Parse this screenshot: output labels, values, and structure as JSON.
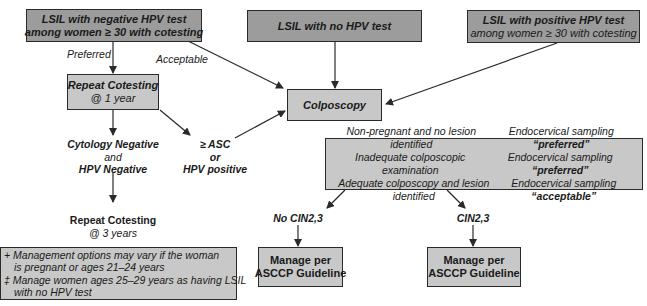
{
  "nodes": {
    "lsil_neg_hpv": {
      "line1": "LSIL with negative HPV test",
      "line2": "among women ≥ 30 with cotesting"
    },
    "lsil_no_hpv": {
      "line1": "LSIL with no HPV test"
    },
    "lsil_pos_hpv": {
      "line1": "LSIL with positive HPV test",
      "line2": "among women ≥ 30 with cotesting"
    },
    "repeat_cotesting_1yr": {
      "line1": "Repeat Cotesting",
      "line2": "@ 1 year"
    },
    "colposcopy": {
      "line1": "Colposcopy"
    },
    "cyto_neg": {
      "line1": "Cytology Negative",
      "line2": "and",
      "line3": "HPV Negative"
    },
    "asc_or_hpv": {
      "line1": "≥ ASC",
      "line2": "or",
      "line3": "HPV positive"
    },
    "repeat_cotesting_3yr": {
      "line1": "Repeat Cotesting",
      "line2": "@ 3 years"
    },
    "endocervical": {
      "rows": [
        {
          "condition": "Non-pregnant and no lesion identified",
          "action": "Endocervical sampling",
          "level": "“preferred”"
        },
        {
          "condition": "Inadequate colposcopic examination",
          "action": "Endocervical sampling",
          "level": "“preferred”"
        },
        {
          "condition": "Adequate colposcopy and lesion identified",
          "action": "Endocervical sampling",
          "level": "“acceptable”"
        }
      ]
    },
    "no_cin": {
      "label": "No CIN2,3"
    },
    "cin": {
      "label": "CIN2,3"
    },
    "manage_1": {
      "line1": "Manage per",
      "line2": "ASCCP Guideline"
    },
    "manage_2": {
      "line1": "Manage per",
      "line2": "ASCCP Guideline"
    }
  },
  "edge_labels": {
    "preferred": "Preferred",
    "acceptable": "Acceptable"
  },
  "footnotes": {
    "line1": "+ Management options may vary if the woman",
    "line2": "is pregnant or ages 21–24 years",
    "line3": "‡ Manage women ages 25–29 years as having LSIL",
    "line4": "with no HPV test"
  }
}
